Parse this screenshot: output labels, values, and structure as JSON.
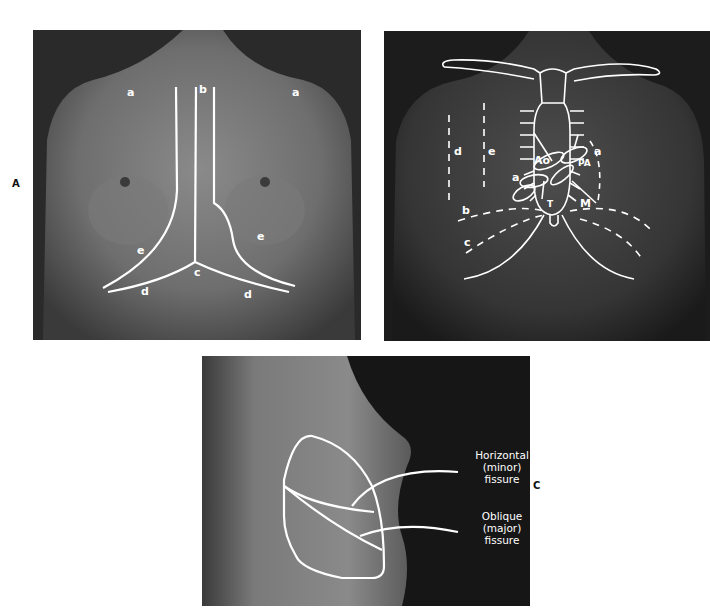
{
  "figure": {
    "panels": [
      {
        "id": "A",
        "letter": "A",
        "description": "Anterior view of female thorax with thoracic landmark lines",
        "labels": {
          "a_left": "a",
          "a_right": "a",
          "b": "b",
          "c": "c",
          "d_left": "d",
          "d_right": "d",
          "e_left": "e",
          "e_right": "e"
        }
      },
      {
        "id": "B",
        "description": "Anterior view of male thorax with sternum, ribs and heart valve areas",
        "labels": {
          "a_upper": "a",
          "a_lower": "a",
          "b": "b",
          "c": "c",
          "d": "d",
          "e": "e",
          "Ao": "Ao",
          "PA": "PA",
          "T": "T",
          "M": "M"
        }
      },
      {
        "id": "C",
        "letter": "C",
        "description": "Lateral view of thorax with lung fissures",
        "callouts": [
          {
            "line1": "Horizontal",
            "line2": "(minor)",
            "line3": "fissure"
          },
          {
            "line1": "Oblique",
            "line2": "(major)",
            "line3": "fissure"
          }
        ]
      }
    ],
    "colors": {
      "overlay": "#ffffff",
      "photo_dark": "#1c1c1c",
      "skin_mid": "#6b6b6b"
    }
  }
}
